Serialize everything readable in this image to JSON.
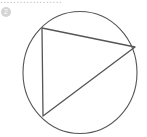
{
  "header": {
    "cut_text": "...................",
    "marker_label": "2"
  },
  "figure": {
    "shapes": [
      "circle",
      "triangle"
    ],
    "stroke_color": "#555555",
    "marker_color": "#d4d4d4"
  }
}
